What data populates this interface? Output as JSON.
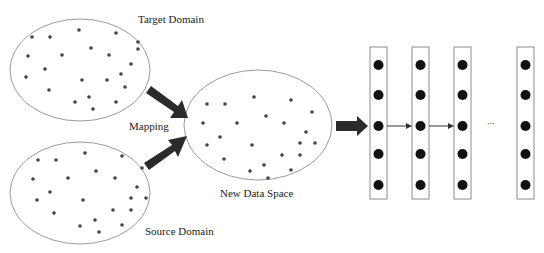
{
  "diagram": {
    "labels": {
      "target_domain": "Target Domain",
      "source_domain": "Source Domain",
      "mapping": "Mapping",
      "new_data_space": "New Data Space",
      "ellipsis": "..."
    },
    "colors": {
      "outline": "#9a9a9a",
      "dot": "#444444",
      "arrow": "#2b2b2b",
      "node": "#111111"
    },
    "nodes": [
      {
        "id": "target_domain",
        "label": "Target Domain",
        "shape": "ellipse",
        "dot_count": 22
      },
      {
        "id": "source_domain",
        "label": "Source Domain",
        "shape": "ellipse",
        "dot_count": 23
      },
      {
        "id": "new_data_space",
        "label": "New Data Space",
        "shape": "ellipse",
        "dot_count": 23
      },
      {
        "id": "layer_1",
        "shape": "column",
        "units": 5
      },
      {
        "id": "layer_2",
        "shape": "column",
        "units": 5
      },
      {
        "id": "layer_3",
        "shape": "column",
        "units": 5
      },
      {
        "id": "layer_n",
        "shape": "column",
        "units": 5
      }
    ],
    "edges": [
      {
        "from": "target_domain",
        "to": "new_data_space",
        "label": "Mapping",
        "style": "thick-arrow"
      },
      {
        "from": "source_domain",
        "to": "new_data_space",
        "label": "Mapping",
        "style": "thick-arrow"
      },
      {
        "from": "new_data_space",
        "to": "layer_1",
        "style": "thick-arrow"
      },
      {
        "from": "layer_1",
        "to": "layer_2",
        "style": "thin-arrow"
      },
      {
        "from": "layer_2",
        "to": "layer_3",
        "style": "thin-arrow"
      },
      {
        "from": "layer_3",
        "to": "layer_n",
        "style": "ellipsis"
      }
    ]
  }
}
